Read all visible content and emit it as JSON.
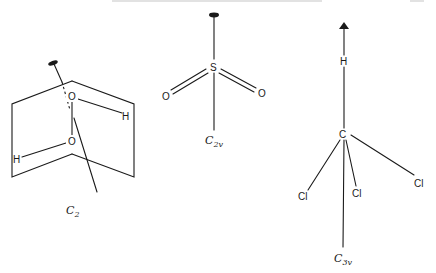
{
  "figure": {
    "molecules": [
      {
        "id": "h2o2",
        "point_group": {
          "main": "C",
          "subscript": "2"
        },
        "atoms": {
          "o_top": "O",
          "o_bottom": "O",
          "h_right": "H",
          "h_left": "H"
        },
        "axis_marker": "ellipse"
      },
      {
        "id": "so2",
        "point_group": {
          "main": "C",
          "subscript": "2v"
        },
        "atoms": {
          "center": "S",
          "o_left": "O",
          "o_right": "O"
        },
        "axis_marker": "ellipse"
      },
      {
        "id": "chcl3",
        "point_group": {
          "main": "C",
          "subscript": "3v"
        },
        "atoms": {
          "center": "C",
          "h_top": "H",
          "cl_left": "Cl",
          "cl_mid": "Cl",
          "cl_right": "Cl"
        },
        "axis_marker": "triangle"
      }
    ]
  },
  "colors": {
    "ink": "#1a1a1a",
    "paper": "#ffffff"
  }
}
